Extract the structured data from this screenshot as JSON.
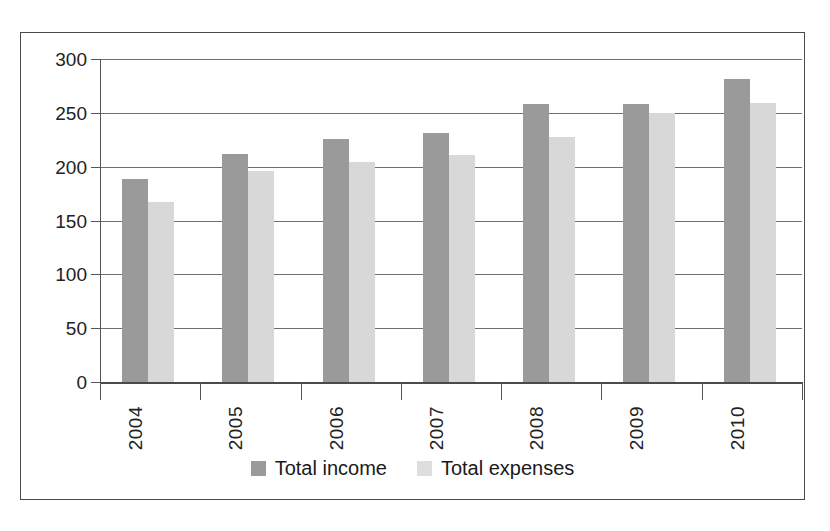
{
  "chart_data": {
    "type": "bar",
    "title": "",
    "subtitle": "",
    "xlabel": "",
    "ylabel": "",
    "categories": [
      "2004",
      "2005",
      "2006",
      "2007",
      "2008",
      "2009",
      "2010"
    ],
    "series": [
      {
        "name": "Total income",
        "color": "#9a9a9a",
        "values": [
          189,
          212,
          226,
          231,
          258,
          258,
          281
        ]
      },
      {
        "name": "Total expenses",
        "color": "#d8d8d8",
        "values": [
          167,
          196,
          204,
          211,
          228,
          250,
          259
        ]
      }
    ],
    "ylim": [
      0,
      300
    ],
    "ytick_values": [
      0,
      50,
      100,
      150,
      200,
      250,
      300
    ],
    "ytick_labels": [
      "0",
      "50",
      "100",
      "150",
      "200",
      "250",
      "300"
    ],
    "grid": true,
    "grid_axis": "y",
    "legend_position": "bottom",
    "xtick_label_rotation": 90,
    "annotations": []
  },
  "legend": {
    "entries": [
      {
        "label": "Total income"
      },
      {
        "label": "Total expenses"
      }
    ]
  }
}
